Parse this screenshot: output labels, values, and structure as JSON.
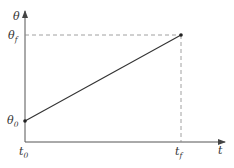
{
  "diagram": {
    "type": "linear-ramp-plot",
    "axes": {
      "y_label": "θ",
      "x_label": "t"
    },
    "y_ticks": [
      {
        "base": "θ",
        "sub": "f"
      },
      {
        "base": "θ",
        "sub": "0"
      }
    ],
    "x_ticks": [
      {
        "base": "t",
        "sub": "0"
      },
      {
        "base": "t",
        "sub": "f"
      }
    ],
    "line": {
      "start": {
        "t": "t0",
        "theta": "θ0"
      },
      "end": {
        "t": "tf",
        "theta": "θf"
      }
    },
    "colors": {
      "axis": "#555555",
      "line": "#333333",
      "dashed": "#888888",
      "text": "#333333"
    }
  }
}
